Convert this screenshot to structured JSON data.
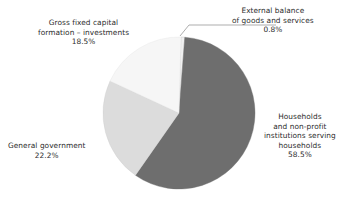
{
  "chart_data": {
    "type": "pie",
    "title": "",
    "subtitle": "",
    "xlabel": "",
    "ylabel": "",
    "grid": false,
    "legend_position": "none",
    "label_style": "outside-callout",
    "units": "percent",
    "total": 100.0,
    "start_angle_deg": 1.5,
    "direction": "clockwise",
    "categories": [
      "External balance of goods and services",
      "Households and non-profit institutions serving households",
      "General government",
      "Gross fixed capital formation – investments"
    ],
    "values": [
      0.8,
      58.5,
      22.2,
      18.5
    ],
    "colors": [
      "#f0f0f0",
      "#6e6e6e",
      "#dcdcdc",
      "#f6f6f6"
    ],
    "slices": [
      {
        "id": "external-balance",
        "name": "External balance of goods and services",
        "value": 0.8,
        "value_label": "0.8%",
        "color": "#f0f0f0",
        "label_lines": [
          "External balance",
          "of goods and services"
        ],
        "has_leader_line": true
      },
      {
        "id": "households",
        "name": "Households and non-profit institutions serving households",
        "value": 58.5,
        "value_label": "58.5%",
        "color": "#6e6e6e",
        "label_lines": [
          "Households",
          "and non-profit",
          "institutions serving",
          "households"
        ],
        "has_leader_line": false
      },
      {
        "id": "general-government",
        "name": "General government",
        "value": 22.2,
        "value_label": "22.2%",
        "color": "#dcdcdc",
        "label_lines": [
          "General government"
        ],
        "has_leader_line": false
      },
      {
        "id": "gross-fixed-capital-formation",
        "name": "Gross fixed capital formation – investments",
        "value": 18.5,
        "value_label": "18.5%",
        "color": "#f6f6f6",
        "label_lines": [
          "Gross fixed capital",
          "formation – investments"
        ],
        "has_leader_line": false
      }
    ]
  },
  "labels": {
    "external": {
      "line1": "External balance",
      "line2": "of goods and services",
      "pct": "0.8%"
    },
    "gfcf": {
      "line1": "Gross fixed capital",
      "line2": "formation – investments",
      "pct": "18.5%"
    },
    "government": {
      "line1": "General government",
      "pct": "22.2%"
    },
    "households": {
      "line1": "Households",
      "line2": "and non-profit",
      "line3": "institutions serving",
      "line4": "households",
      "pct": "58.5%"
    }
  },
  "colors": {
    "background": "#ffffff",
    "text": "#2c2c2c",
    "slice_households": "#6e6e6e",
    "slice_government": "#dcdcdc",
    "slice_gfcf": "#f6f6f6",
    "slice_external": "#f0f0f0",
    "leader_line": "#8a8a8a"
  }
}
